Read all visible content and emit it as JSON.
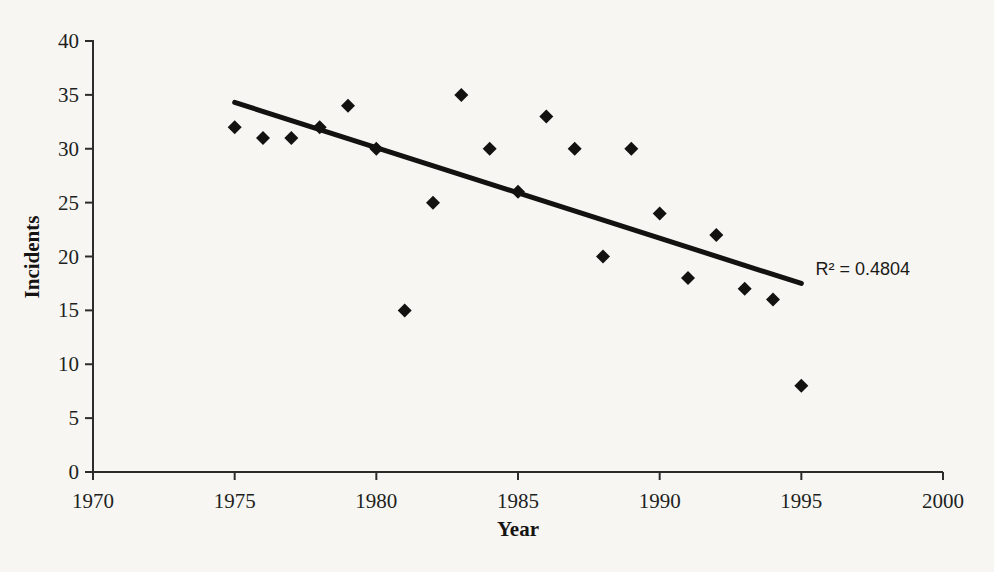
{
  "figure": {
    "background_color": "#f7f6f3",
    "ink_color": "#141210"
  },
  "chart_data": {
    "type": "scatter",
    "title": "",
    "xlabel": "Year",
    "ylabel": "Incidents",
    "xlim": [
      1970,
      2000
    ],
    "ylim": [
      0,
      40
    ],
    "x_ticks": [
      1970,
      1975,
      1980,
      1985,
      1990,
      1995,
      2000
    ],
    "y_ticks": [
      0,
      5,
      10,
      15,
      20,
      25,
      30,
      35,
      40
    ],
    "grid": false,
    "legend": "none",
    "marker": "diamond",
    "marker_color": "#141210",
    "points": [
      {
        "x": 1975,
        "y": 32
      },
      {
        "x": 1976,
        "y": 31
      },
      {
        "x": 1977,
        "y": 31
      },
      {
        "x": 1978,
        "y": 32
      },
      {
        "x": 1979,
        "y": 34
      },
      {
        "x": 1980,
        "y": 30
      },
      {
        "x": 1981,
        "y": 15
      },
      {
        "x": 1982,
        "y": 25
      },
      {
        "x": 1983,
        "y": 35
      },
      {
        "x": 1984,
        "y": 30
      },
      {
        "x": 1985,
        "y": 26
      },
      {
        "x": 1986,
        "y": 33
      },
      {
        "x": 1987,
        "y": 30
      },
      {
        "x": 1988,
        "y": 20
      },
      {
        "x": 1989,
        "y": 30
      },
      {
        "x": 1990,
        "y": 24
      },
      {
        "x": 1991,
        "y": 18
      },
      {
        "x": 1992,
        "y": 22
      },
      {
        "x": 1993,
        "y": 17
      },
      {
        "x": 1994,
        "y": 16
      },
      {
        "x": 1995,
        "y": 8
      }
    ],
    "trendline": {
      "type": "linear",
      "x1": 1975,
      "y1": 34.3,
      "x2": 1995,
      "y2": 17.5
    },
    "annotation": {
      "text": "R² = 0.4804",
      "x": 1995.5,
      "y": 18.8
    }
  }
}
